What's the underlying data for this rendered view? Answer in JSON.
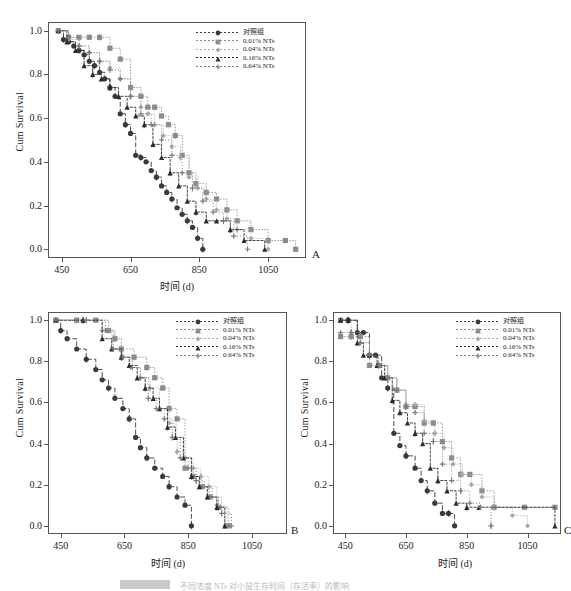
{
  "figure": {
    "background": "#ffffff",
    "width": 571,
    "height": 590,
    "axis_color": "#555555"
  },
  "legend_series": [
    {
      "label": "对照组",
      "color": "#3a3a3a",
      "marker": "circle",
      "dash": "5,2"
    },
    {
      "label": "0.01% NTs",
      "color": "#8c8c8c",
      "marker": "square",
      "dash": "1.5,1.5"
    },
    {
      "label": "0.04% NTs",
      "color": "#a8a8a8",
      "marker": "diamond",
      "dash": "1,1.5"
    },
    {
      "label": "0.16% NTs",
      "color": "#2b2b2b",
      "marker": "triangle",
      "dash": "3,1"
    },
    {
      "label": "0.64% NTs",
      "color": "#7a7a7a",
      "marker": "plus",
      "dash": "1,2"
    }
  ],
  "axes": {
    "xlabel": "时间 (d)",
    "ylabel": "Cum Survival",
    "xticks": [
      "450",
      "650",
      "850",
      "1050"
    ],
    "xtick_values": [
      450,
      650,
      850,
      1050
    ],
    "yticks": [
      "0.0",
      "0.2",
      "0.4",
      "0.6",
      "0.8",
      "1.0"
    ],
    "ytick_values": [
      0.0,
      0.2,
      0.4,
      0.6,
      0.8,
      1.0
    ],
    "xlim": [
      410,
      1160
    ],
    "ylim": [
      -0.04,
      1.04
    ]
  },
  "panels": [
    {
      "letter": "A"
    },
    {
      "letter": "B"
    },
    {
      "letter": "C"
    }
  ],
  "caption": {
    "badge": "图 4-1",
    "text": "不同浓度 NTs 对小鼠生存时间（存活率）的影响"
  },
  "chart_data": [
    {
      "type": "line",
      "panel": "A",
      "title": "",
      "xlabel": "时间 (d)",
      "ylabel": "Cum Survival",
      "xlim": [
        410,
        1160
      ],
      "ylim": [
        -0.04,
        1.04
      ],
      "grid": false,
      "legend_position": "top-right",
      "series": [
        {
          "name": "对照组",
          "x": [
            440,
            455,
            470,
            485,
            500,
            515,
            530,
            545,
            560,
            575,
            590,
            605,
            620,
            635,
            650,
            665,
            680,
            695,
            710,
            725,
            740,
            755,
            770,
            785,
            800,
            815,
            830,
            845,
            860
          ],
          "y": [
            1.0,
            0.96,
            0.95,
            0.93,
            0.91,
            0.89,
            0.86,
            0.84,
            0.81,
            0.78,
            0.74,
            0.7,
            0.62,
            0.57,
            0.53,
            0.43,
            0.42,
            0.4,
            0.36,
            0.33,
            0.29,
            0.26,
            0.23,
            0.19,
            0.16,
            0.13,
            0.1,
            0.05,
            0.0
          ]
        },
        {
          "name": "0.01% NTs",
          "x": [
            440,
            470,
            500,
            530,
            560,
            590,
            620,
            650,
            680,
            700,
            720,
            740,
            760,
            780,
            800,
            820,
            840,
            870,
            900,
            930,
            960,
            1000,
            1050,
            1100,
            1130
          ],
          "y": [
            1.0,
            0.97,
            0.97,
            0.97,
            0.97,
            0.92,
            0.87,
            0.74,
            0.7,
            0.65,
            0.65,
            0.61,
            0.57,
            0.52,
            0.43,
            0.35,
            0.3,
            0.26,
            0.23,
            0.18,
            0.13,
            0.09,
            0.04,
            0.04,
            0.0
          ]
        },
        {
          "name": "0.04% NTs",
          "x": [
            440,
            470,
            500,
            530,
            560,
            590,
            620,
            650,
            680,
            700,
            720,
            745,
            770,
            795,
            820,
            845,
            870,
            900,
            930,
            960,
            1000,
            1050
          ],
          "y": [
            1.0,
            0.96,
            0.93,
            0.9,
            0.86,
            0.83,
            0.78,
            0.7,
            0.65,
            0.62,
            0.57,
            0.52,
            0.47,
            0.42,
            0.33,
            0.28,
            0.23,
            0.18,
            0.14,
            0.09,
            0.05,
            0.0
          ]
        },
        {
          "name": "0.16% NTs",
          "x": [
            440,
            465,
            490,
            515,
            540,
            565,
            590,
            615,
            640,
            665,
            690,
            715,
            740,
            765,
            790,
            815,
            840,
            870,
            900,
            940,
            980,
            1040
          ],
          "y": [
            1.0,
            0.95,
            0.91,
            0.84,
            0.8,
            0.78,
            0.74,
            0.7,
            0.65,
            0.61,
            0.57,
            0.48,
            0.42,
            0.35,
            0.29,
            0.22,
            0.17,
            0.13,
            0.13,
            0.09,
            0.04,
            0.0
          ]
        },
        {
          "name": "0.64% NTs",
          "x": [
            440,
            470,
            500,
            530,
            560,
            590,
            620,
            650,
            680,
            710,
            740,
            770,
            800,
            830,
            860,
            890,
            920,
            950,
            990
          ],
          "y": [
            1.0,
            0.97,
            0.93,
            0.9,
            0.86,
            0.82,
            0.78,
            0.7,
            0.62,
            0.57,
            0.5,
            0.43,
            0.35,
            0.28,
            0.22,
            0.17,
            0.13,
            0.06,
            0.0
          ]
        }
      ]
    },
    {
      "type": "line",
      "panel": "B",
      "title": "",
      "xlabel": "时间 (d)",
      "ylabel": "Cum Survival",
      "xlim": [
        410,
        1160
      ],
      "ylim": [
        -0.04,
        1.04
      ],
      "grid": false,
      "legend_position": "top-right",
      "series": [
        {
          "name": "对照组",
          "x": [
            435,
            450,
            470,
            500,
            530,
            560,
            580,
            600,
            620,
            645,
            665,
            685,
            700,
            720,
            745,
            770,
            790,
            815,
            840,
            860
          ],
          "y": [
            1.0,
            0.95,
            0.91,
            0.86,
            0.81,
            0.76,
            0.71,
            0.67,
            0.62,
            0.57,
            0.52,
            0.43,
            0.38,
            0.33,
            0.28,
            0.24,
            0.19,
            0.14,
            0.1,
            0.0
          ]
        },
        {
          "name": "0.01% NTs",
          "x": [
            435,
            500,
            560,
            600,
            620,
            640,
            680,
            720,
            745,
            770,
            790,
            815,
            840,
            865,
            890,
            915,
            945,
            975
          ],
          "y": [
            1.0,
            1.0,
            1.0,
            0.95,
            0.91,
            0.86,
            0.82,
            0.77,
            0.72,
            0.67,
            0.57,
            0.52,
            0.28,
            0.24,
            0.19,
            0.14,
            0.09,
            0.0
          ]
        },
        {
          "name": "0.04% NTs",
          "x": [
            435,
            520,
            580,
            610,
            640,
            670,
            700,
            730,
            760,
            790,
            815,
            840,
            865,
            890,
            915,
            940,
            965
          ],
          "y": [
            1.0,
            1.0,
            0.95,
            0.86,
            0.82,
            0.77,
            0.72,
            0.67,
            0.57,
            0.5,
            0.36,
            0.33,
            0.28,
            0.24,
            0.19,
            0.1,
            0.0
          ]
        },
        {
          "name": "0.16% NTs",
          "x": [
            435,
            520,
            580,
            610,
            640,
            665,
            690,
            715,
            740,
            760,
            785,
            810,
            835,
            860,
            885,
            910,
            940,
            965
          ],
          "y": [
            1.0,
            1.0,
            0.91,
            0.86,
            0.82,
            0.78,
            0.72,
            0.67,
            0.62,
            0.57,
            0.48,
            0.43,
            0.33,
            0.24,
            0.19,
            0.14,
            0.09,
            0.0
          ]
        },
        {
          "name": "0.64% NTs",
          "x": [
            435,
            530,
            590,
            615,
            645,
            675,
            700,
            725,
            750,
            775,
            800,
            825,
            850,
            875,
            900,
            925,
            955,
            985
          ],
          "y": [
            1.0,
            1.0,
            0.95,
            0.86,
            0.82,
            0.77,
            0.72,
            0.62,
            0.57,
            0.52,
            0.43,
            0.33,
            0.28,
            0.22,
            0.19,
            0.14,
            0.06,
            0.0
          ]
        }
      ]
    },
    {
      "type": "line",
      "panel": "C",
      "title": "",
      "xlabel": "时间 (d)",
      "ylabel": "Cum Survival",
      "xlim": [
        410,
        1160
      ],
      "ylim": [
        -0.04,
        1.04
      ],
      "grid": false,
      "legend_position": "top-right",
      "series": [
        {
          "name": "对照组",
          "x": [
            435,
            460,
            490,
            510,
            530,
            550,
            570,
            590,
            610,
            630,
            650,
            680,
            700,
            720,
            745,
            770,
            790,
            810
          ],
          "y": [
            1.0,
            1.0,
            0.94,
            0.94,
            0.83,
            0.83,
            0.72,
            0.67,
            0.45,
            0.39,
            0.34,
            0.28,
            0.22,
            0.17,
            0.11,
            0.06,
            0.06,
            0.0
          ]
        },
        {
          "name": "0.01% NTs",
          "x": [
            435,
            470,
            500,
            530,
            560,
            590,
            620,
            650,
            680,
            710,
            740,
            770,
            800,
            830,
            860,
            900,
            940,
            1040,
            1140
          ],
          "y": [
            0.92,
            0.92,
            0.92,
            0.78,
            0.78,
            0.72,
            0.66,
            0.58,
            0.58,
            0.5,
            0.5,
            0.41,
            0.33,
            0.25,
            0.25,
            0.17,
            0.09,
            0.09,
            0.09
          ]
        },
        {
          "name": "0.04% NTs",
          "x": [
            435,
            470,
            500,
            530,
            560,
            590,
            620,
            650,
            680,
            710,
            745,
            775,
            805,
            835,
            865,
            900,
            940,
            1000,
            1050
          ],
          "y": [
            1.0,
            0.94,
            0.89,
            0.83,
            0.78,
            0.72,
            0.66,
            0.59,
            0.59,
            0.51,
            0.45,
            0.38,
            0.3,
            0.25,
            0.2,
            0.14,
            0.09,
            0.05,
            0.0
          ]
        },
        {
          "name": "0.16% NTs",
          "x": [
            435,
            460,
            490,
            510,
            530,
            555,
            580,
            605,
            630,
            655,
            680,
            705,
            730,
            755,
            785,
            815,
            850,
            890,
            1140
          ],
          "y": [
            1.0,
            1.0,
            0.89,
            0.83,
            0.83,
            0.78,
            0.72,
            0.61,
            0.55,
            0.5,
            0.45,
            0.4,
            0.28,
            0.22,
            0.17,
            0.11,
            0.09,
            0.09,
            0.0
          ]
        },
        {
          "name": "0.64% NTs",
          "x": [
            435,
            470,
            500,
            530,
            560,
            590,
            620,
            650,
            680,
            710,
            740,
            770,
            800,
            830,
            860,
            895,
            930
          ],
          "y": [
            0.94,
            0.94,
            0.89,
            0.83,
            0.78,
            0.72,
            0.66,
            0.58,
            0.55,
            0.45,
            0.41,
            0.3,
            0.22,
            0.17,
            0.11,
            0.09,
            0.0
          ]
        }
      ]
    }
  ]
}
